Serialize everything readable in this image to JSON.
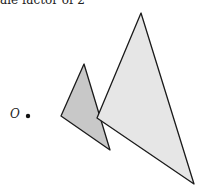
{
  "caption": "ale factor of 2",
  "center_label": "O",
  "colors": {
    "small_fill": "#c8c8c8",
    "large_fill": "#e6e6e6",
    "stroke": "#1a1a1a"
  },
  "shapes": {
    "small_triangle": [
      [
        84,
        64
      ],
      [
        61,
        116
      ],
      [
        110,
        150
      ]
    ],
    "large_triangle": [
      [
        141,
        13
      ],
      [
        97,
        118
      ],
      [
        194,
        184
      ]
    ],
    "center_point": [
      28,
      116
    ]
  }
}
